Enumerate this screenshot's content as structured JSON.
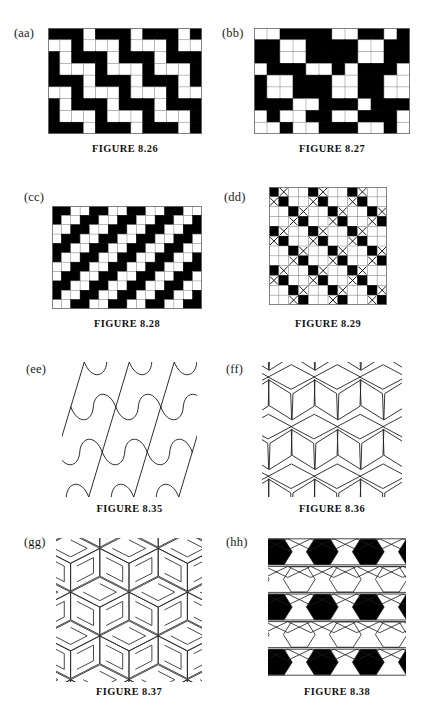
{
  "page": {
    "width": 439,
    "height": 717,
    "background": "#ffffff",
    "ink": "#000000",
    "kind": "textbook-figure-plate",
    "topic": "Periodic tilings and tessellation patterns"
  },
  "figures": [
    {
      "id": "aa",
      "label": "(aa)",
      "caption": "FIGURE 8.26",
      "type": "grid",
      "cols": 13,
      "rows": 9,
      "box": {
        "x": 48,
        "y": 28,
        "w": 154,
        "h": 106
      },
      "label_pos": {
        "x": 14,
        "y": 26
      },
      "caption_pos": {
        "x": 48,
        "y": 143,
        "w": 154
      },
      "legend": {
        "1": "black square",
        "0": "white square"
      },
      "matrix": [
        [
          1,
          1,
          1,
          0,
          1,
          1,
          1,
          0,
          1,
          1,
          1,
          0,
          1
        ],
        [
          0,
          0,
          1,
          0,
          0,
          0,
          1,
          0,
          0,
          0,
          1,
          0,
          0
        ],
        [
          1,
          0,
          1,
          1,
          1,
          0,
          1,
          1,
          1,
          0,
          1,
          1,
          1
        ],
        [
          1,
          0,
          0,
          0,
          1,
          0,
          0,
          0,
          1,
          0,
          0,
          0,
          1
        ],
        [
          1,
          1,
          1,
          0,
          1,
          1,
          1,
          0,
          1,
          1,
          1,
          0,
          1
        ],
        [
          0,
          0,
          1,
          0,
          0,
          0,
          1,
          0,
          0,
          0,
          1,
          0,
          0
        ],
        [
          1,
          0,
          1,
          1,
          1,
          0,
          1,
          1,
          1,
          0,
          1,
          1,
          1
        ],
        [
          1,
          0,
          0,
          0,
          1,
          0,
          0,
          0,
          1,
          0,
          0,
          0,
          1
        ],
        [
          1,
          1,
          1,
          0,
          1,
          1,
          1,
          0,
          1,
          1,
          1,
          0,
          1
        ]
      ]
    },
    {
      "id": "bb",
      "label": "(bb)",
      "caption": "FIGURE 8.27",
      "type": "grid",
      "cols": 12,
      "rows": 9,
      "box": {
        "x": 254,
        "y": 28,
        "w": 156,
        "h": 106
      },
      "label_pos": {
        "x": 222,
        "y": 26
      },
      "caption_pos": {
        "x": 254,
        "y": 143,
        "w": 156
      },
      "legend": {
        "1": "black square",
        "0": "white square"
      },
      "matrix": [
        [
          0,
          0,
          1,
          1,
          1,
          1,
          0,
          0,
          1,
          1,
          0,
          1
        ],
        [
          1,
          1,
          0,
          0,
          1,
          1,
          1,
          1,
          0,
          0,
          1,
          1
        ],
        [
          1,
          1,
          0,
          0,
          1,
          1,
          1,
          1,
          0,
          0,
          1,
          1
        ],
        [
          0,
          1,
          1,
          1,
          0,
          0,
          1,
          0,
          1,
          1,
          1,
          0
        ],
        [
          1,
          0,
          0,
          1,
          1,
          1,
          0,
          0,
          1,
          1,
          0,
          0
        ],
        [
          1,
          0,
          0,
          1,
          1,
          1,
          0,
          0,
          1,
          1,
          0,
          0
        ],
        [
          1,
          1,
          1,
          0,
          0,
          1,
          1,
          1,
          0,
          1,
          1,
          1
        ],
        [
          0,
          1,
          0,
          0,
          1,
          1,
          0,
          0,
          1,
          1,
          1,
          0
        ],
        [
          0,
          0,
          1,
          0,
          0,
          1,
          1,
          1,
          0,
          0,
          1,
          0
        ]
      ]
    },
    {
      "id": "cc",
      "label": "(cc)",
      "caption": "FIGURE 8.28",
      "type": "grid",
      "cols": 16,
      "rows": 11,
      "box": {
        "x": 52,
        "y": 206,
        "w": 150,
        "h": 103
      },
      "label_pos": {
        "x": 24,
        "y": 190
      },
      "caption_pos": {
        "x": 52,
        "y": 318,
        "w": 150
      },
      "legend": {
        "1": "black square",
        "0": "white square"
      },
      "matrix": [
        [
          1,
          1,
          0,
          0,
          1,
          1,
          0,
          0,
          1,
          1,
          0,
          0,
          1,
          1,
          0,
          0
        ],
        [
          1,
          0,
          0,
          1,
          1,
          0,
          0,
          1,
          1,
          0,
          0,
          1,
          1,
          0,
          0,
          1
        ],
        [
          0,
          0,
          1,
          1,
          0,
          0,
          1,
          1,
          0,
          0,
          1,
          1,
          0,
          0,
          1,
          1
        ],
        [
          0,
          1,
          1,
          0,
          0,
          1,
          1,
          0,
          0,
          1,
          1,
          0,
          0,
          1,
          1,
          0
        ],
        [
          1,
          1,
          0,
          0,
          1,
          1,
          0,
          0,
          1,
          1,
          0,
          0,
          1,
          1,
          0,
          0
        ],
        [
          1,
          0,
          0,
          1,
          1,
          0,
          0,
          1,
          1,
          0,
          0,
          1,
          1,
          0,
          0,
          1
        ],
        [
          0,
          0,
          1,
          1,
          0,
          0,
          1,
          1,
          0,
          0,
          1,
          1,
          0,
          0,
          1,
          1
        ],
        [
          0,
          1,
          1,
          0,
          0,
          1,
          1,
          0,
          0,
          1,
          1,
          0,
          0,
          1,
          1,
          0
        ],
        [
          1,
          1,
          0,
          0,
          1,
          1,
          0,
          0,
          1,
          1,
          0,
          0,
          1,
          1,
          0,
          0
        ],
        [
          1,
          0,
          0,
          1,
          1,
          0,
          0,
          1,
          1,
          0,
          0,
          1,
          1,
          0,
          0,
          1
        ],
        [
          0,
          0,
          1,
          1,
          0,
          0,
          1,
          1,
          0,
          0,
          1,
          1,
          0,
          0,
          1,
          1
        ]
      ]
    },
    {
      "id": "dd",
      "label": "(dd)",
      "caption": "FIGURE 8.29",
      "type": "grid",
      "cols": 12,
      "rows": 12,
      "box": {
        "x": 269,
        "y": 187,
        "w": 118,
        "h": 118
      },
      "label_pos": {
        "x": 224,
        "y": 190
      },
      "caption_pos": {
        "x": 269,
        "y": 318,
        "w": 118
      },
      "legend": {
        "1": "black square",
        "0": "white square",
        "2": "white square with X"
      },
      "matrix": [
        [
          1,
          2,
          0,
          0,
          1,
          2,
          0,
          0,
          1,
          2,
          0,
          0
        ],
        [
          2,
          1,
          0,
          0,
          2,
          1,
          0,
          0,
          2,
          1,
          0,
          0
        ],
        [
          0,
          0,
          1,
          2,
          0,
          0,
          1,
          2,
          0,
          0,
          1,
          2
        ],
        [
          0,
          0,
          2,
          1,
          0,
          0,
          2,
          1,
          0,
          0,
          2,
          1
        ],
        [
          1,
          2,
          0,
          0,
          1,
          2,
          0,
          0,
          1,
          2,
          0,
          0
        ],
        [
          2,
          1,
          0,
          0,
          2,
          1,
          0,
          0,
          2,
          1,
          0,
          0
        ],
        [
          0,
          0,
          1,
          2,
          0,
          0,
          1,
          2,
          0,
          0,
          1,
          2
        ],
        [
          0,
          0,
          2,
          1,
          0,
          0,
          2,
          1,
          0,
          0,
          2,
          1
        ],
        [
          1,
          2,
          0,
          0,
          1,
          2,
          0,
          0,
          1,
          2,
          0,
          0
        ],
        [
          2,
          1,
          0,
          0,
          2,
          1,
          0,
          0,
          2,
          1,
          0,
          0
        ],
        [
          0,
          0,
          1,
          2,
          0,
          0,
          1,
          2,
          0,
          0,
          1,
          2
        ],
        [
          0,
          0,
          2,
          1,
          0,
          0,
          2,
          1,
          0,
          0,
          2,
          1
        ]
      ]
    },
    {
      "id": "ee",
      "label": "(ee)",
      "caption": "FIGURE 8.35",
      "type": "line-art",
      "art": "curved-rhombus-tiling",
      "box": {
        "x": 62,
        "y": 362,
        "w": 135,
        "h": 135
      },
      "label_pos": {
        "x": 26,
        "y": 362
      },
      "caption_pos": {
        "x": 62,
        "y": 503,
        "w": 135
      },
      "description": "Tessellation of curved quadrilateral tiles with S-curve edges"
    },
    {
      "id": "ff",
      "label": "(ff)",
      "caption": "FIGURE 8.36",
      "type": "line-art",
      "art": "rhombus-star-tiling",
      "box": {
        "x": 262,
        "y": 362,
        "w": 140,
        "h": 135
      },
      "label_pos": {
        "x": 226,
        "y": 362
      },
      "caption_pos": {
        "x": 262,
        "y": 503,
        "w": 140
      },
      "description": "Tessellation of rhombi forming six-pointed stars and hexagons"
    },
    {
      "id": "gg",
      "label": "(gg)",
      "caption": "FIGURE 8.37",
      "type": "line-art",
      "art": "pinwheel-zigzag-tiling",
      "box": {
        "x": 56,
        "y": 538,
        "w": 146,
        "h": 144
      },
      "label_pos": {
        "x": 24,
        "y": 535
      },
      "caption_pos": {
        "x": 56,
        "y": 686,
        "w": 146
      },
      "description": "Interlocking zigzag rhombic pinwheel tiling, isometric look"
    },
    {
      "id": "hh",
      "label": "(hh)",
      "caption": "FIGURE 8.38",
      "type": "line-art",
      "art": "hexagon-triangle-tiling",
      "box": {
        "x": 268,
        "y": 538,
        "w": 138,
        "h": 138
      },
      "label_pos": {
        "x": 226,
        "y": 535
      },
      "caption_pos": {
        "x": 268,
        "y": 686,
        "w": 138
      },
      "description": "Hexagons (alternating black and white) with triangle star lattice"
    }
  ]
}
